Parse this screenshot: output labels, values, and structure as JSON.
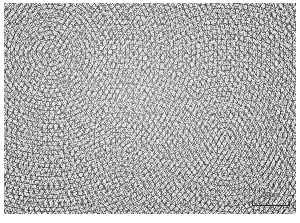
{
  "figure": {
    "type": "micrograph",
    "modality": "optical-micrograph",
    "color_mode": "grayscale",
    "colors": {
      "grain_interior": "#cdcdcd",
      "grain_boundary": "#3c3c3c",
      "plate_mean": "#c9c9c9",
      "margin": "#ffffff",
      "annotation_text": "#2a2a2a"
    }
  },
  "scale_bar": {
    "value": "50",
    "unit": "μm",
    "label": "50μm",
    "position": "bottom-right",
    "bar_length_px": 38
  }
}
